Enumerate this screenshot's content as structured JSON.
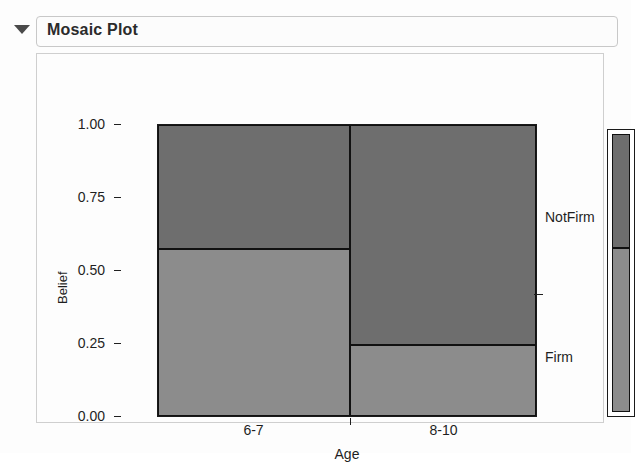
{
  "panel": {
    "title": "Mosaic Plot",
    "disclosure_icon": "triangle-down-icon",
    "disclosure_state": "expanded"
  },
  "chart_data": {
    "type": "mosaic",
    "title": "Mosaic Plot",
    "xlabel": "Age",
    "ylabel": "Belief",
    "ylim": [
      0.0,
      1.0
    ],
    "grid": false,
    "legend_position": "right",
    "categories": [
      "6-7",
      "8-10"
    ],
    "column_widths": [
      0.508,
      0.492
    ],
    "response_levels": [
      "Firm",
      "NotFirm"
    ],
    "y_ticks": [
      "0.00",
      "0.25",
      "0.50",
      "0.75",
      "1.00"
    ],
    "y_tick_values": [
      0.0,
      0.25,
      0.5,
      0.75,
      1.0
    ],
    "series": [
      {
        "name": "Firm",
        "values": [
          0.575,
          0.245
        ]
      },
      {
        "name": "NotFirm",
        "values": [
          0.425,
          0.755
        ]
      }
    ],
    "overall_proportions": {
      "Firm": 0.41,
      "NotFirm": 0.59
    },
    "cells": [
      {
        "column": "6-7",
        "level": "NotFirm",
        "from": 0.575,
        "to": 1.0,
        "proportion": 0.425,
        "color": "#6e6e6e"
      },
      {
        "column": "6-7",
        "level": "Firm",
        "from": 0.0,
        "to": 0.575,
        "proportion": 0.575,
        "color": "#8c8c8c"
      },
      {
        "column": "8-10",
        "level": "NotFirm",
        "from": 0.245,
        "to": 1.0,
        "proportion": 0.755,
        "color": "#6e6e6e"
      },
      {
        "column": "8-10",
        "level": "Firm",
        "from": 0.0,
        "to": 0.245,
        "proportion": 0.245,
        "color": "#8c8c8c"
      }
    ],
    "legend_strip": [
      {
        "level": "NotFirm",
        "from": 0.59,
        "to": 1.0,
        "color": "#6e6e6e"
      },
      {
        "level": "Firm",
        "from": 0.0,
        "to": 0.59,
        "color": "#8c8c8c"
      }
    ],
    "right_axis_tick": 0.59
  },
  "colors": {
    "cell_dark": "#6e6e6e",
    "cell_light": "#8c8c8c",
    "border": "#111111",
    "axis": "#1f1f1f",
    "panel_border": "#cfcfcf",
    "title_border": "#c8c8c8",
    "background": "#fdfdfd"
  }
}
